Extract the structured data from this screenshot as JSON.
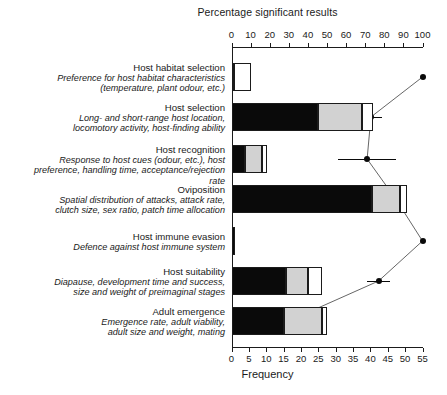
{
  "chart_data": {
    "type": "bar",
    "title": "Percentage significant results",
    "xlabel": "Frequency",
    "ylabel": "",
    "orientation": "horizontal",
    "stacked": true,
    "grid": false,
    "legend": "none",
    "bottom_axis": {
      "label": "Frequency",
      "range": [
        0,
        55
      ],
      "ticks": [
        0,
        5,
        10,
        15,
        20,
        25,
        30,
        35,
        40,
        45,
        50,
        55
      ],
      "tick_labels": [
        "0",
        "5",
        "10",
        "15",
        "20",
        "25",
        "30",
        "35",
        "40",
        "45",
        "50",
        "55"
      ]
    },
    "top_axis": {
      "label": "Percentage significant results",
      "range": [
        0,
        100
      ],
      "ticks": [
        0,
        10,
        20,
        30,
        40,
        50,
        60,
        70,
        80,
        90,
        100
      ],
      "tick_labels": [
        "0",
        "10",
        "20",
        "30",
        "40",
        "50",
        "60",
        "70",
        "80",
        "90",
        "100"
      ]
    },
    "segment_names": [
      "significant",
      "non-significant",
      "not-reported"
    ],
    "segment_colors": [
      "#0a0a0a",
      "#d2d2d2",
      "#ffffff"
    ],
    "categories": [
      {
        "name": "Host habitat selection",
        "description": "Preference for host habitat characteristics (temperature, plant odour, etc.)",
        "desc_lines": [
          "Preference for host habitat characteristics",
          "(temperature, plant odour, etc.)"
        ],
        "segments": [
          0.6,
          0.0,
          4.9
        ],
        "total": 5.5,
        "percentage": 100.0,
        "error_low": 100.0,
        "error_high": 100.0
      },
      {
        "name": "Host selection",
        "description": "Long- and short-range host location, locomotory activity, host-finding ability",
        "desc_lines": [
          "Long- and short-range host location,",
          "locomotory activity, host-finding ability"
        ],
        "segments": [
          24.8,
          12.7,
          3.2
        ],
        "total": 40.7,
        "percentage": 73.0,
        "error_low": 67.0,
        "error_high": 79.0
      },
      {
        "name": "Host recognition",
        "description": "Response to host cues (odour, etc.), host preference, handling time, acceptance/rejection rate",
        "desc_lines": [
          "Response to host cues (odour, etc.), host",
          "preference, handling time, acceptance/rejection rate"
        ],
        "segments": [
          4.0,
          4.9,
          1.2
        ],
        "total": 10.1,
        "percentage": 71.0,
        "error_low": 56.0,
        "error_high": 86.0
      },
      {
        "name": "Oviposition",
        "description": "Spatial distribution of attacks, attack rate, clutch size, sex ratio, patch time allocation",
        "desc_lines": [
          "Spatial distribution of attacks, attack rate,",
          "clutch size, sex ratio, patch time allocation"
        ],
        "segments": [
          40.6,
          7.8,
          2.0
        ],
        "total": 50.4,
        "percentage": 86.0,
        "error_low": 83.0,
        "error_high": 89.0
      },
      {
        "name": "Host immune evasion",
        "description": "Defence against host immune system",
        "desc_lines": [
          "Defence against host immune system"
        ],
        "segments": [
          0.9,
          0.0,
          0.0
        ],
        "total": 0.9,
        "percentage": 100.0,
        "error_low": 100.0,
        "error_high": 100.0
      },
      {
        "name": "Host suitability",
        "description": "Diapause, development time and success, size and weight of preimaginal stages",
        "desc_lines": [
          "Diapause, development time and success,",
          "size and weight of preimaginal stages"
        ],
        "segments": [
          15.8,
          6.3,
          4.0
        ],
        "total": 26.1,
        "percentage": 77.0,
        "error_low": 71.0,
        "error_high": 83.0
      },
      {
        "name": "Adult emergence",
        "description": "Emergence rate, adult viability, adult size and weight, mating",
        "desc_lines": [
          "Emergence rate, adult viability,",
          "adult size and weight, mating"
        ],
        "segments": [
          15.0,
          11.2,
          1.2
        ],
        "total": 27.4,
        "percentage": 30.0,
        "error_low": 30.0,
        "error_high": 37.0
      }
    ]
  }
}
